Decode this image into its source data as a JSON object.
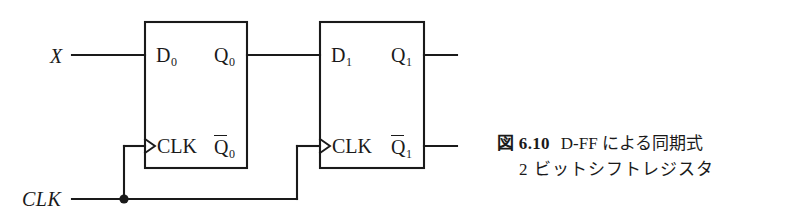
{
  "figure": {
    "background_color": "#ffffff",
    "line_color": "#1a1a1a",
    "caption": {
      "number": "図 6.10",
      "line1_title": "D-FF による同期式",
      "line2": "2 ビットシフトレジスタ"
    },
    "inputs": [
      {
        "name": "X",
        "label": "X"
      },
      {
        "name": "CLK",
        "label": "CLK"
      }
    ],
    "flipflops": [
      {
        "id": "ff0",
        "d_label": "D",
        "d_sub": "0",
        "q_label": "Q",
        "q_sub": "0",
        "clk_label": "CLK",
        "qbar_label": "Q",
        "qbar_sub": "0"
      },
      {
        "id": "ff1",
        "d_label": "D",
        "d_sub": "1",
        "q_label": "Q",
        "q_sub": "1",
        "clk_label": "CLK",
        "qbar_label": "Q",
        "qbar_sub": "1"
      }
    ]
  }
}
